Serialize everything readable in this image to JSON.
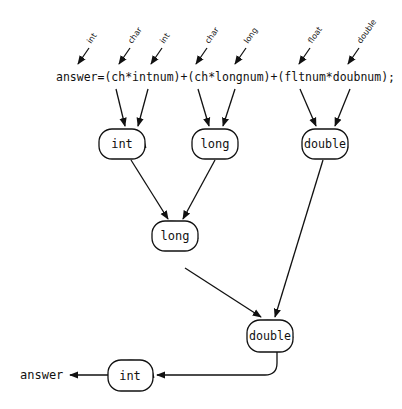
{
  "diagram": {
    "expression": "answer=(ch*intnum)+(ch*longnum)+(fltnum*doubnum);",
    "operand_type_labels": [
      {
        "id": "answer",
        "label": "int"
      },
      {
        "id": "ch1",
        "label": "char"
      },
      {
        "id": "intnum",
        "label": "int"
      },
      {
        "id": "ch2",
        "label": "char"
      },
      {
        "id": "longnum",
        "label": "long"
      },
      {
        "id": "fltnum",
        "label": "float"
      },
      {
        "id": "doubnum",
        "label": "double"
      }
    ],
    "nodes": [
      {
        "id": "n1",
        "label": "int"
      },
      {
        "id": "n2",
        "label": "long"
      },
      {
        "id": "n3",
        "label": "double"
      },
      {
        "id": "n4",
        "label": "long"
      },
      {
        "id": "n5",
        "label": "double"
      },
      {
        "id": "n6",
        "label": "int"
      }
    ],
    "edges": [
      {
        "from": "ch1",
        "to": "n1"
      },
      {
        "from": "intnum",
        "to": "n1"
      },
      {
        "from": "ch2",
        "to": "n2"
      },
      {
        "from": "longnum",
        "to": "n2"
      },
      {
        "from": "fltnum",
        "to": "n3"
      },
      {
        "from": "doubnum",
        "to": "n3"
      },
      {
        "from": "n1",
        "to": "n4"
      },
      {
        "from": "n2",
        "to": "n4"
      },
      {
        "from": "n4",
        "to": "n5"
      },
      {
        "from": "n3",
        "to": "n5"
      },
      {
        "from": "n5",
        "to": "n6"
      },
      {
        "from": "n6",
        "to": "result"
      }
    ],
    "result_label": "answer"
  }
}
